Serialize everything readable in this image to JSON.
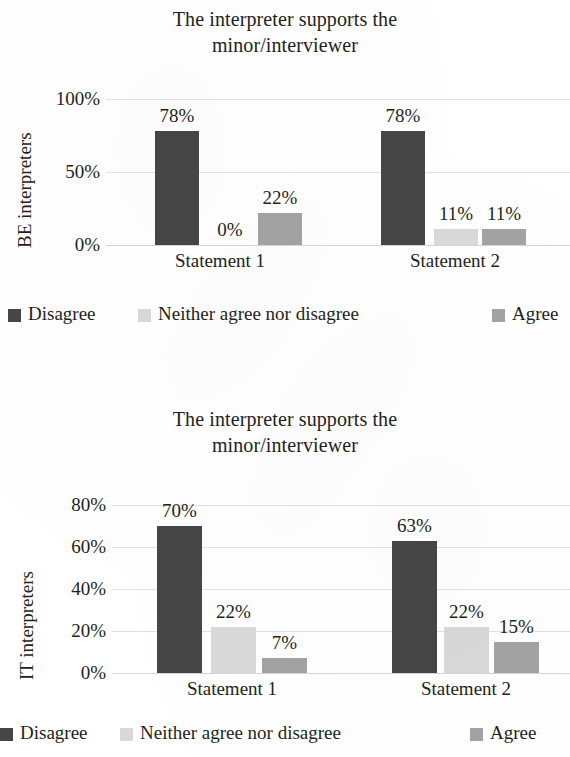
{
  "palette": {
    "disagree": "#464646",
    "neither": "#d9d9d9",
    "agree": "#a3a3a3",
    "gridline": "#e2e2e2",
    "text": "#231f20",
    "background": "#ffffff"
  },
  "charts": [
    {
      "id": "be-interpreters",
      "title_line1": "The interpreter supports the",
      "title_line2": "minor/interviewer",
      "y_axis_title": "BE interpreters",
      "y_ticks": [
        "100%",
        "50%",
        "0%"
      ],
      "categories": [
        "Statement 1",
        "Statement 2"
      ],
      "legend": [
        {
          "label": "Disagree",
          "swatch": "disagree"
        },
        {
          "label": "Neither agree nor disagree",
          "swatch": "neither"
        },
        {
          "label": "Agree",
          "swatch": "agree"
        }
      ],
      "bars": [
        {
          "category": "Statement 1",
          "series": "Disagree",
          "value": 78,
          "label": "78%"
        },
        {
          "category": "Statement 1",
          "series": "Neither agree nor disagree",
          "value": 0,
          "label": "0%"
        },
        {
          "category": "Statement 1",
          "series": "Agree",
          "value": 22,
          "label": "22%"
        },
        {
          "category": "Statement 2",
          "series": "Disagree",
          "value": 78,
          "label": "78%"
        },
        {
          "category": "Statement 2",
          "series": "Neither agree nor disagree",
          "value": 11,
          "label": "11%"
        },
        {
          "category": "Statement 2",
          "series": "Agree",
          "value": 11,
          "label": "11%"
        }
      ]
    },
    {
      "id": "it-interpreters",
      "title_line1": "The interpreter supports the",
      "title_line2": "minor/interviewer",
      "y_axis_title": "IT interpreters",
      "y_ticks": [
        "80%",
        "60%",
        "40%",
        "20%",
        "0%"
      ],
      "categories": [
        "Statement 1",
        "Statement 2"
      ],
      "legend": [
        {
          "label": "Disagree",
          "swatch": "disagree"
        },
        {
          "label": "Neither agree nor disagree",
          "swatch": "neither"
        },
        {
          "label": "Agree",
          "swatch": "agree"
        }
      ],
      "bars": [
        {
          "category": "Statement 1",
          "series": "Disagree",
          "value": 70,
          "label": "70%"
        },
        {
          "category": "Statement 1",
          "series": "Neither agree nor disagree",
          "value": 22,
          "label": "22%"
        },
        {
          "category": "Statement 1",
          "series": "Agree",
          "value": 7,
          "label": "7%"
        },
        {
          "category": "Statement 2",
          "series": "Disagree",
          "value": 63,
          "label": "63%"
        },
        {
          "category": "Statement 2",
          "series": "Neither agree nor disagree",
          "value": 22,
          "label": "22%"
        },
        {
          "category": "Statement 2",
          "series": "Agree",
          "value": 15,
          "label": "15%"
        }
      ]
    }
  ],
  "chart_data": [
    {
      "type": "bar",
      "title": "The interpreter supports the minor/interviewer",
      "xlabel": "",
      "ylabel": "BE interpreters",
      "categories": [
        "Statement 1",
        "Statement 2"
      ],
      "series": [
        {
          "name": "Disagree",
          "values": [
            78,
            78
          ],
          "color": "#464646"
        },
        {
          "name": "Neither agree nor disagree",
          "values": [
            0,
            11
          ],
          "color": "#d9d9d9"
        },
        {
          "name": "Agree",
          "values": [
            22,
            11
          ],
          "color": "#a3a3a3"
        }
      ],
      "data_labels": [
        [
          "78%",
          "0%",
          "22%"
        ],
        [
          "78%",
          "11%",
          "11%"
        ]
      ],
      "ylim": [
        0,
        100
      ],
      "yticks": [
        0,
        50,
        100
      ],
      "ytick_labels": [
        "0%",
        "50%",
        "100%"
      ],
      "grid": true,
      "legend_position": "bottom"
    },
    {
      "type": "bar",
      "title": "The interpreter supports the minor/interviewer",
      "xlabel": "",
      "ylabel": "IT interpreters",
      "categories": [
        "Statement 1",
        "Statement 2"
      ],
      "series": [
        {
          "name": "Disagree",
          "values": [
            70,
            63
          ],
          "color": "#464646"
        },
        {
          "name": "Neither agree nor disagree",
          "values": [
            22,
            22
          ],
          "color": "#d9d9d9"
        },
        {
          "name": "Agree",
          "values": [
            7,
            15
          ],
          "color": "#a3a3a3"
        }
      ],
      "data_labels": [
        [
          "70%",
          "22%",
          "7%"
        ],
        [
          "63%",
          "22%",
          "15%"
        ]
      ],
      "ylim": [
        0,
        80
      ],
      "yticks": [
        0,
        20,
        40,
        60,
        80
      ],
      "ytick_labels": [
        "0%",
        "20%",
        "40%",
        "60%",
        "80%"
      ],
      "grid": true,
      "legend_position": "bottom"
    }
  ]
}
